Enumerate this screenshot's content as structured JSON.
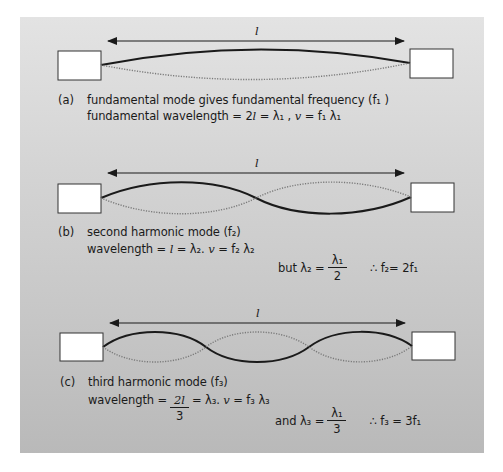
{
  "figure": {
    "length_label": "l",
    "panels": [
      {
        "id": "a",
        "tag": "(a)",
        "title": "fundamental mode gives fundamental frequency (f₁ )",
        "line2": {
          "prefix": "fundamental wavelength = 2",
          "l": "l",
          "mid": " = λ₁ , ",
          "v": "v",
          "suffix": " = f₁ λ₁"
        },
        "harmonic": 1
      },
      {
        "id": "b",
        "tag": "(b)",
        "title": "second harmonic mode (f₂)",
        "line2": {
          "prefix": "wavelength = ",
          "l": "l",
          "mid": " = λ₂.  ",
          "v": "v",
          "suffix": " = f₂ λ₂"
        },
        "relation": {
          "lead": "but λ₂ =",
          "numerator": "λ₁",
          "denominator": "2",
          "result": "∴ f₂= 2f₁"
        },
        "harmonic": 2
      },
      {
        "id": "c",
        "tag": "(c)",
        "title": "third harmonic mode (f₃)",
        "line2": {
          "prefix": "wavelength =",
          "numerator": "2l",
          "denominator": "3",
          "mid": "= λ₃.  ",
          "v": "v",
          "suffix": " = f₃ λ₃"
        },
        "relation": {
          "lead": "and λ₃ =",
          "numerator": "λ₁",
          "denominator": "3",
          "result": "∴ f₃ = 3f₁"
        },
        "harmonic": 3
      }
    ],
    "colors": {
      "background_top": "#e3e3e3",
      "background_bottom": "#b9b9b9",
      "string_solid": "#1a1a1a",
      "string_dotted": "#7a7a7a",
      "support_fill": "#ffffff"
    }
  }
}
